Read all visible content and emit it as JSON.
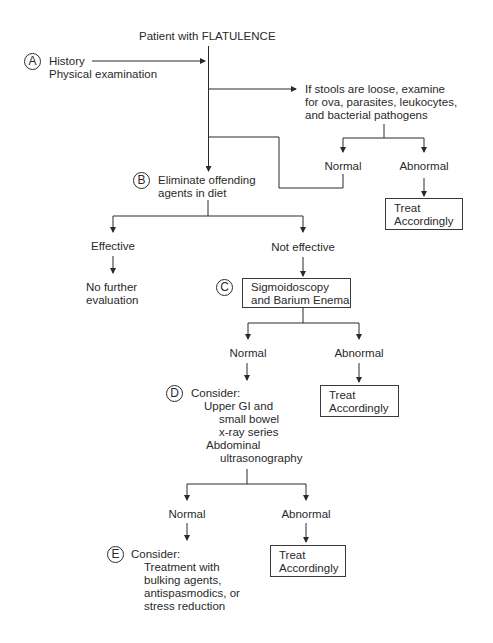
{
  "diagram": {
    "title": "Patient with FLATULENCE",
    "steps": {
      "A": {
        "marker": "A",
        "lines": [
          "History",
          "Physical examination"
        ]
      },
      "stool_check": {
        "lines": [
          "If stools are loose, examine",
          "for ova, parasites, leukocytes,",
          "and bacterial pathogens"
        ],
        "normal": "Normal",
        "abnormal": "Abnormal",
        "abnormal_action": [
          "Treat",
          "Accordingly"
        ]
      },
      "B": {
        "marker": "B",
        "lines": [
          "Eliminate offending",
          "agents in diet"
        ],
        "effective": "Effective",
        "effective_result": [
          "No further",
          "evaluation"
        ],
        "not_effective": "Not effective"
      },
      "C": {
        "marker": "C",
        "lines": [
          "Sigmoidoscopy",
          "and Barium Enema"
        ],
        "normal": "Normal",
        "abnormal": "Abnormal",
        "abnormal_action": [
          "Treat",
          "Accordingly"
        ]
      },
      "D": {
        "marker": "D",
        "lines": [
          "Consider:",
          "Upper GI and",
          "small bowel",
          "x-ray series",
          "Abdominal",
          "ultrasonography"
        ],
        "normal": "Normal",
        "abnormal": "Abnormal",
        "abnormal_action": [
          "Treat",
          "Accordingly"
        ]
      },
      "E": {
        "marker": "E",
        "lines": [
          "Consider:",
          "Treatment with",
          "bulking agents,",
          "antispasmodics, or",
          "stress reduction"
        ]
      }
    },
    "line_color": "#2a2a2a"
  }
}
